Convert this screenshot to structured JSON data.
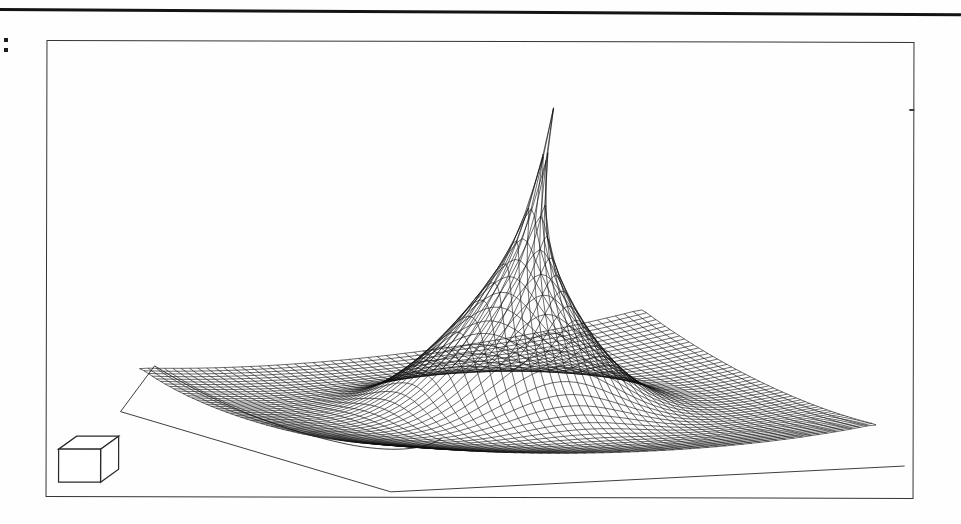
{
  "page": {
    "background_color": "#fefefe",
    "ink_color": "#111111",
    "top_rule": {
      "name": "horizontal-rule",
      "color": "#141414",
      "thickness_px": 3
    },
    "margin_mark": {
      "name": "colon-artifact",
      "glyph": ":",
      "color": "#1c1c1c"
    }
  },
  "figure": {
    "frame": {
      "border_color": "#33353a",
      "border_width_px": 1.3,
      "x": 46,
      "y": 41,
      "width": 868,
      "height": 457
    },
    "legend": {
      "icon_name": "wireframe-cube-icon",
      "label": "",
      "stroke_color": "#2b2b2b",
      "fill_color": "#ffffff"
    }
  },
  "chart_data": {
    "type": "surface",
    "render": "wireframe-mesh",
    "title": "",
    "subtitle": "",
    "xlabel": "",
    "ylabel": "",
    "zlabel": "",
    "grid": true,
    "legend_position": "bottom-left",
    "axes_visible": false,
    "tick_labels": {
      "x": [],
      "y": [],
      "z": []
    },
    "annotations": [],
    "colors": {
      "line": "#111111",
      "surface_fill": "#ffffff",
      "base": "#1b1b1b"
    },
    "surface": {
      "function": "peak",
      "nu": 56,
      "nv": 52,
      "u_range": [
        -1,
        1
      ],
      "v_range": [
        -1,
        1
      ],
      "peak_height": 1.0,
      "peak_sharpness": 7.5,
      "skirt_height": 0.1
    },
    "projection": {
      "apex": {
        "x": 511,
        "y": 66
      },
      "corner_left": {
        "x": 75,
        "y": 360
      },
      "corner_front": {
        "x": 345,
        "y": 437
      },
      "corner_right": {
        "x": 845,
        "y": 415
      },
      "corner_back": {
        "x": 600,
        "y": 300
      },
      "base_front": {
        "x": 345,
        "y": 452
      },
      "base_left": {
        "x": 74,
        "y": 372
      },
      "base_right": {
        "x": 860,
        "y": 425
      }
    },
    "axis_ranges": {
      "x": [
        -1,
        1
      ],
      "y": [
        -1,
        1
      ],
      "z": [
        0,
        1
      ]
    }
  }
}
